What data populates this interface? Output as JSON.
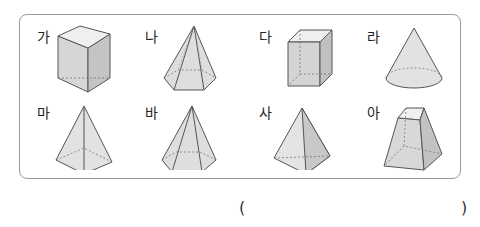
{
  "shapes": [
    {
      "label": "가",
      "name": "triangular-prism"
    },
    {
      "label": "나",
      "name": "hexagonal-pyramid"
    },
    {
      "label": "다",
      "name": "cube"
    },
    {
      "label": "라",
      "name": "cone"
    },
    {
      "label": "마",
      "name": "square-pyramid"
    },
    {
      "label": "바",
      "name": "hexagonal-pyramid"
    },
    {
      "label": "사",
      "name": "triangular-pyramid"
    },
    {
      "label": "아",
      "name": "square-frustum"
    }
  ],
  "answer": {
    "open": "(",
    "close": ")",
    "value": ""
  },
  "colors": {
    "border": "#9a9a9a",
    "fill": "#dcdcdc",
    "stroke": "#555555"
  }
}
